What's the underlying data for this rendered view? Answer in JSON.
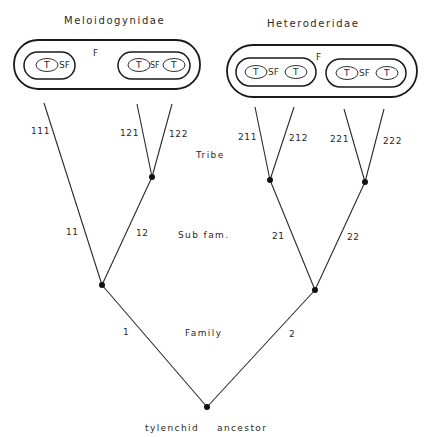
{
  "diagram": {
    "families": [
      {
        "name": "Meloidogynidae",
        "family_label": "F",
        "subfamilies": [
          {
            "sf_label": "SF",
            "tribes": [
              "T"
            ]
          },
          {
            "sf_label": "SF",
            "tribes": [
              "T",
              "T"
            ]
          }
        ]
      },
      {
        "name": "Heteroderidae",
        "family_label": "F",
        "subfamilies": [
          {
            "sf_label": "SF",
            "tribes": [
              "T",
              "T"
            ]
          },
          {
            "sf_label": "SF",
            "tribes": [
              "T",
              "T"
            ]
          }
        ]
      }
    ],
    "ranks": {
      "tribe": "Tribe",
      "subfamily": "Sub fam.",
      "family": "Family"
    },
    "root_label": {
      "word1": "tylenchid",
      "word2": "ancestor"
    },
    "branches": {
      "b1": "1",
      "b2": "2",
      "b11": "11",
      "b12": "12",
      "b21": "21",
      "b22": "22",
      "b111": "111",
      "b121": "121",
      "b122": "122",
      "b211": "211",
      "b212": "212",
      "b221": "221",
      "b222": "222"
    }
  }
}
